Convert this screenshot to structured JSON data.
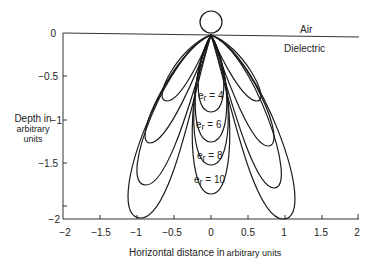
{
  "figure": {
    "type": "radiation-pattern-diagram",
    "y_axis": {
      "label_line1": "Depth in",
      "label_line2": "arbitrary",
      "label_line3": "units",
      "ticks": [
        "0",
        "−0.5",
        "−1",
        "−1.5",
        "−2"
      ]
    },
    "x_axis": {
      "label_main": "Horizontal distance in",
      "label_units": "arbitrary units",
      "ticks": [
        "−2",
        "−1.5",
        "−1",
        "−0.5",
        "0",
        "0.5",
        "1",
        "1.5",
        "2"
      ]
    },
    "regions": {
      "upper": "Air",
      "lower": "Dielectric"
    },
    "lobes": [
      {
        "label_base": "e",
        "label_sub": "r",
        "label_value": " = 4"
      },
      {
        "label_base": "e",
        "label_sub": "r",
        "label_value": " = 6"
      },
      {
        "label_base": "e",
        "label_sub": "r",
        "label_value": " = 8"
      },
      {
        "label_base": "e",
        "label_sub": "r",
        "label_value": " = 10"
      }
    ]
  }
}
